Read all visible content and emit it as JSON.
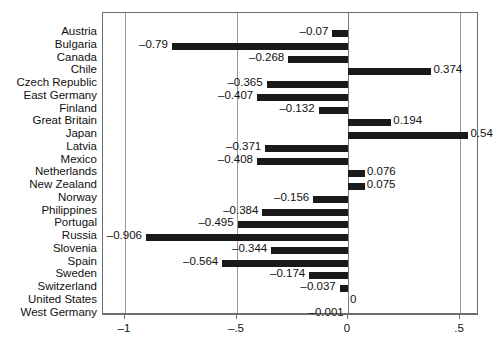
{
  "chart_data": {
    "type": "bar",
    "orientation": "horizontal",
    "title": "",
    "subtitle": "",
    "xlabel": "",
    "ylabel": "",
    "xlim": [
      -1.09,
      0.59
    ],
    "ylim": [
      0,
      22
    ],
    "grid": true,
    "gridlines_vertical": [
      -1,
      -0.5,
      0,
      0.5
    ],
    "legend": null,
    "legend_position": "none",
    "bar_color": "#1a1a1a",
    "axis_color": "#6d6d6d",
    "xticks": [
      -1,
      -0.5,
      0,
      0.5
    ],
    "xticklabels": [
      "–1",
      "–.5",
      "0",
      ".5"
    ],
    "categories": [
      "Austria",
      "Bulgaria",
      "Canada",
      "Chile",
      "Czech Republic",
      "East Germany",
      "Finland",
      "Great Britain",
      "Japan",
      "Latvia",
      "Mexico",
      "Netherlands",
      "New Zealand",
      "Norway",
      "Philippines",
      "Portugal",
      "Russia",
      "Slovenia",
      "Spain",
      "Sweden",
      "Switzerland",
      "United States",
      "West Germany"
    ],
    "values": [
      -0.07,
      -0.79,
      -0.268,
      0.374,
      -0.365,
      -0.407,
      -0.132,
      0.194,
      0.54,
      -0.371,
      -0.408,
      0.076,
      0.075,
      -0.156,
      -0.384,
      -0.495,
      -0.906,
      -0.344,
      -0.564,
      -0.174,
      -0.037,
      0,
      -0.001
    ],
    "data_labels": [
      "–0.07",
      "–0.79",
      "–0.268",
      "0.374",
      "–0.365",
      "–0.407",
      "–0.132",
      "0.194",
      "0.54",
      "–0.371",
      "–0.408",
      "0.076",
      "0.075",
      "–0.156",
      "–0.384",
      "–0.495",
      "–0.906",
      "–0.344",
      "–0.564",
      "–0.174",
      "–0.037",
      "0",
      "–0.001"
    ]
  }
}
